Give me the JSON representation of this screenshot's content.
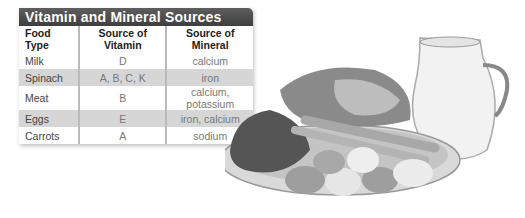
{
  "table": {
    "title": "Vitamin and Mineral Sources",
    "headers": [
      "Food Type",
      "Source of Vitamin",
      "Source of Mineral"
    ],
    "rows": [
      [
        "Milk",
        "D",
        "calcium"
      ],
      [
        "Spinach",
        "A, B, C, K",
        "iron"
      ],
      [
        "Meat",
        "B",
        "calcium, potassium"
      ],
      [
        "Eggs",
        "E",
        "iron, calcium"
      ],
      [
        "Carrots",
        "A",
        "sodium"
      ]
    ]
  },
  "photo": {
    "description": "Plate of spinach, meat, carrots and eggs beside a pitcher of milk"
  },
  "colors": {
    "title_bar": "#4a4a4a",
    "shaded_row": "#d6d6d6"
  }
}
